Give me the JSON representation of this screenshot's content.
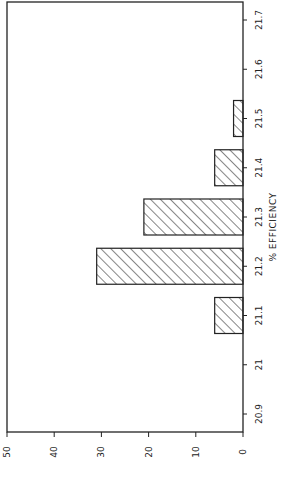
{
  "chart_data": {
    "type": "bar",
    "orientation": "rotated-90",
    "title": "",
    "xlabel": "% EFFICIENCY",
    "ylabel": "",
    "categories": [
      "20.9",
      "21",
      "21.1",
      "21.2",
      "21.3",
      "21.4",
      "21.5",
      "21.6",
      "21.7"
    ],
    "values": [
      0,
      0,
      6,
      31,
      21,
      6,
      2,
      0,
      0
    ],
    "category_tick_labels": [
      "20.9",
      "21",
      "21.1",
      "21.2",
      "21.3",
      "21.4",
      "21.5",
      "21.6",
      "21.7"
    ],
    "value_ticks": [
      0,
      10,
      20,
      30,
      40,
      50
    ],
    "value_tick_labels": [
      "0",
      "10",
      "20",
      "30",
      "40",
      "50"
    ],
    "ylim": [
      0,
      50
    ],
    "grid": false,
    "legend": "none",
    "bar_fill": "diagonal-hatch",
    "colors": {
      "line": "#222222",
      "background": "#ffffff"
    }
  }
}
